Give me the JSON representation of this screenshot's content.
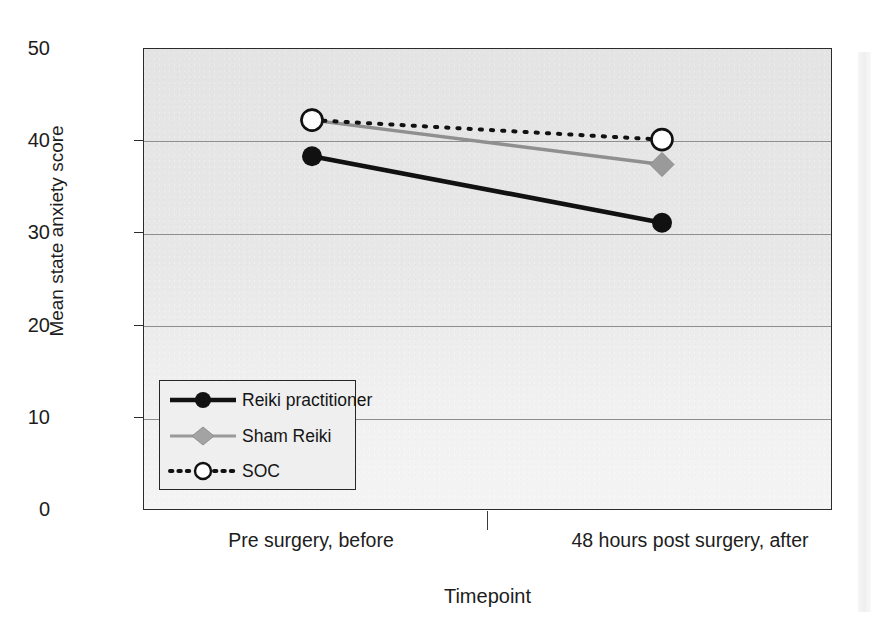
{
  "chart_data": {
    "type": "line",
    "title": "",
    "xlabel": "Timepoint",
    "ylabel": "Mean state anxiety score",
    "categories": [
      "Pre surgery, before",
      "48 hours post surgery, after"
    ],
    "ylim": [
      0,
      50
    ],
    "yticks": [
      "0",
      "10",
      "20",
      "30",
      "40",
      "50"
    ],
    "ytick_values": [
      0,
      10,
      20,
      30,
      40,
      50
    ],
    "grid": "horizontal",
    "legend_position": "inside-lower-left",
    "series": [
      {
        "name": "Reiki practitioner",
        "values": [
          38.4,
          31.2
        ],
        "color": "#111111",
        "line_style": "solid",
        "marker": "filled-circle"
      },
      {
        "name": "Sham Reiki",
        "values": [
          42.3,
          37.5
        ],
        "color": "#8f8f8f",
        "line_style": "solid",
        "marker": "filled-diamond"
      },
      {
        "name": "SOC",
        "values": [
          42.3,
          40.2
        ],
        "color": "#111111",
        "line_style": "dotted",
        "marker": "open-circle"
      }
    ]
  },
  "axes": {
    "y_title": "Mean state anxiety score",
    "x_title": "Timepoint",
    "y_ticks": [
      "50",
      "40",
      "30",
      "20",
      "10",
      "0"
    ],
    "x_ticks": [
      "Pre surgery, before",
      "48 hours post surgery, after"
    ]
  },
  "legend": {
    "items": [
      {
        "label": "Reiki practitioner"
      },
      {
        "label": "Sham Reiki"
      },
      {
        "label": "SOC"
      }
    ]
  },
  "colors": {
    "series_dark": "#111111",
    "series_gray": "#8f8f8f",
    "plot_background": "#ececec",
    "gridline": "#8e8e8e",
    "frame": "#2b2b2b"
  }
}
